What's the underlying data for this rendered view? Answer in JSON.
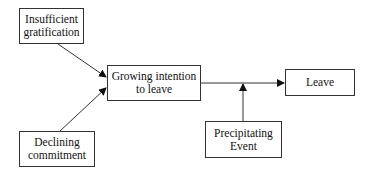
{
  "diagram": {
    "type": "flowchart",
    "nodes": [
      {
        "id": "insufficient",
        "lines": [
          "Insufficient",
          "gratification"
        ]
      },
      {
        "id": "declining",
        "lines": [
          "Declining",
          "commitment"
        ]
      },
      {
        "id": "growing",
        "lines": [
          "Growing intention",
          "to leave"
        ]
      },
      {
        "id": "precipitating",
        "lines": [
          "Precipitating",
          "Event"
        ]
      },
      {
        "id": "leave",
        "lines": [
          "Leave"
        ]
      }
    ],
    "edges": [
      {
        "from": "insufficient",
        "to": "growing"
      },
      {
        "from": "declining",
        "to": "growing"
      },
      {
        "from": "growing",
        "to": "leave"
      },
      {
        "from": "precipitating",
        "to": "growing-leave-edge"
      }
    ],
    "colors": {
      "stroke": "#333333",
      "background": "#ffffff"
    }
  }
}
